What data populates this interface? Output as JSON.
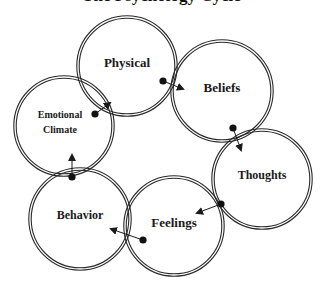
{
  "title": "The Psychology Cycle",
  "colors": {
    "stroke": "#2a2a2a",
    "background": "#ffffff",
    "text": "#1a1a1a"
  },
  "nodes": [
    {
      "id": "physical",
      "label_lines": [
        "Physical"
      ],
      "cx": 127,
      "cy": 66,
      "r": 49,
      "font_size": 13
    },
    {
      "id": "beliefs",
      "label_lines": [
        "Beliefs"
      ],
      "cx": 222,
      "cy": 91,
      "r": 50,
      "font_size": 13
    },
    {
      "id": "thoughts",
      "label_lines": [
        "Thoughts"
      ],
      "cx": 262,
      "cy": 179,
      "r": 49,
      "font_size": 12
    },
    {
      "id": "feelings",
      "label_lines": [
        "Feelings"
      ],
      "cx": 174,
      "cy": 226,
      "r": 49,
      "font_size": 13
    },
    {
      "id": "behavior",
      "label_lines": [
        "Behavior"
      ],
      "cx": 80,
      "cy": 219,
      "r": 50,
      "font_size": 12
    },
    {
      "id": "emotional-climate",
      "label_lines": [
        "Emotional",
        "Climate"
      ],
      "cx": 64,
      "cy": 126,
      "r": 49,
      "font_size": 10
    }
  ],
  "arrows": [
    {
      "from": "physical",
      "to": "beliefs",
      "x1": 163,
      "y1": 81,
      "x2": 183,
      "y2": 89
    },
    {
      "from": "beliefs",
      "to": "thoughts",
      "x1": 233,
      "y1": 128,
      "x2": 241,
      "y2": 150
    },
    {
      "from": "thoughts",
      "to": "feelings",
      "x1": 221,
      "y1": 204,
      "x2": 197,
      "y2": 213
    },
    {
      "from": "feelings",
      "to": "behavior",
      "x1": 143,
      "y1": 240,
      "x2": 111,
      "y2": 229
    },
    {
      "from": "behavior",
      "to": "emotional-climate",
      "x1": 72,
      "y1": 177,
      "x2": 72,
      "y2": 155
    },
    {
      "from": "emotional-climate",
      "to": "physical",
      "x1": 95,
      "y1": 114,
      "x2": 110,
      "y2": 103
    }
  ]
}
